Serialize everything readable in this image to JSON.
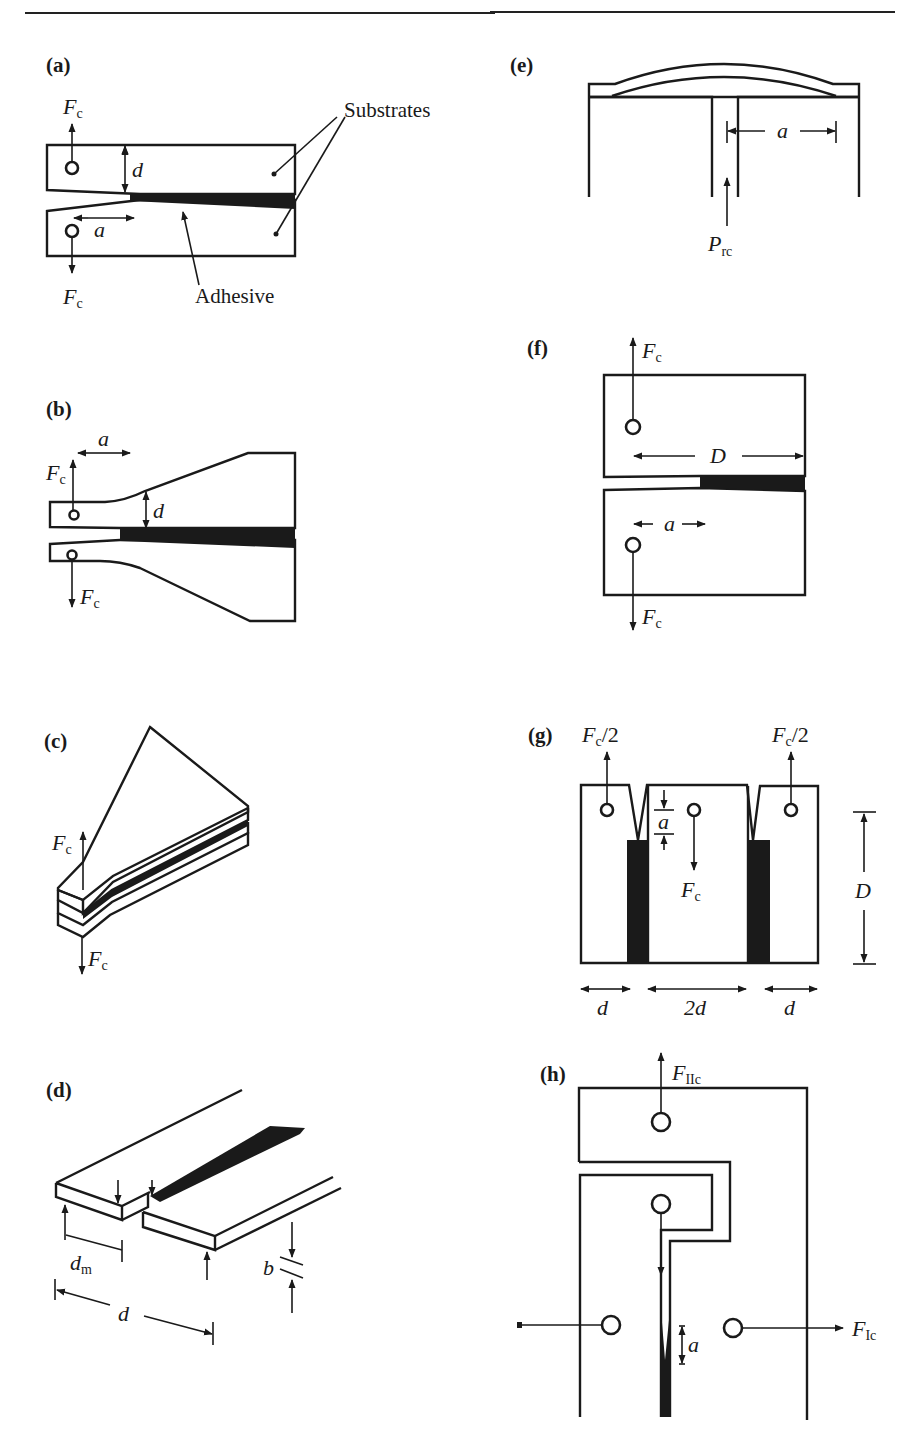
{
  "figure": {
    "header_rule": true,
    "panels": [
      {
        "id": "a",
        "label": "(a)",
        "description": "Double cantilever beam specimen",
        "annotations": {
          "force_top": "F",
          "force_top_sub": "c",
          "force_bottom": "F",
          "force_bottom_sub": "c",
          "thickness": "d",
          "crack_length": "a",
          "substrates_label": "Substrates",
          "adhesive_label": "Adhesive"
        }
      },
      {
        "id": "b",
        "label": "(b)",
        "description": "Tapered double cantilever beam specimen",
        "annotations": {
          "crack_length": "a",
          "force_top": "F",
          "force_top_sub": "c",
          "thickness": "d",
          "force_bottom": "F",
          "force_bottom_sub": "c"
        }
      },
      {
        "id": "c",
        "label": "(c)",
        "description": "Width-tapered beam specimen",
        "annotations": {
          "force_top": "F",
          "force_top_sub": "c",
          "force_bottom": "F",
          "force_bottom_sub": "c"
        }
      },
      {
        "id": "d",
        "label": "(d)",
        "description": "Cleavage specimen with bonded strips",
        "annotations": {
          "dm": "d",
          "dm_sub": "m",
          "d": "d",
          "b": "b"
        }
      },
      {
        "id": "e",
        "label": "(e)",
        "description": "Blister test",
        "annotations": {
          "crack_length": "a",
          "pressure": "P",
          "pressure_sub": "rc"
        }
      },
      {
        "id": "f",
        "label": "(f)",
        "description": "Compact tension specimen",
        "annotations": {
          "force_top": "F",
          "force_top_sub": "c",
          "width": "D",
          "crack_length": "a",
          "force_bottom": "F",
          "force_bottom_sub": "c"
        }
      },
      {
        "id": "g",
        "label": "(g)",
        "description": "Double-joint specimen",
        "annotations": {
          "force_left": "F",
          "force_left_sub": "c",
          "force_left_suffix": "/2",
          "force_right": "F",
          "force_right_sub": "c",
          "force_right_suffix": "/2",
          "crack_length": "a",
          "force_center": "F",
          "force_center_sub": "c",
          "height": "D",
          "width_left": "d",
          "width_center": "2d",
          "width_right": "d"
        }
      },
      {
        "id": "h",
        "label": "(h)",
        "description": "Mixed-mode specimen",
        "annotations": {
          "force_II": "F",
          "force_II_sub": "IIc",
          "force_I": "F",
          "force_I_sub": "Ic",
          "crack_length": "a"
        }
      }
    ]
  }
}
